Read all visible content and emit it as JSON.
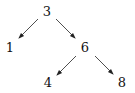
{
  "diagram": {
    "type": "binary-tree",
    "nodes": [
      {
        "id": "n3",
        "label": "3",
        "x": 47,
        "y": 12
      },
      {
        "id": "n1",
        "label": "1",
        "x": 10,
        "y": 48
      },
      {
        "id": "n6",
        "label": "6",
        "x": 85,
        "y": 48
      },
      {
        "id": "n4",
        "label": "4",
        "x": 48,
        "y": 83
      },
      {
        "id": "n8",
        "label": "8",
        "x": 122,
        "y": 83
      }
    ],
    "edges": [
      {
        "from": "3",
        "to": "1"
      },
      {
        "from": "3",
        "to": "6"
      },
      {
        "from": "6",
        "to": "4"
      },
      {
        "from": "6",
        "to": "8"
      }
    ]
  }
}
